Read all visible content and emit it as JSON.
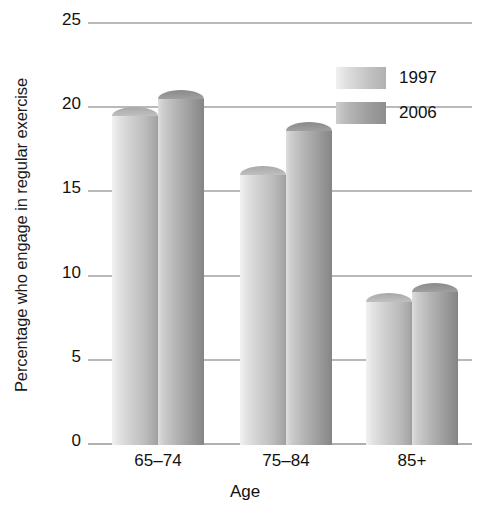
{
  "chart_data": {
    "type": "bar",
    "title": "",
    "xlabel": "Age",
    "ylabel": "Percentage who engage in regular exercise",
    "categories": [
      "65–74",
      "75–84",
      "85+"
    ],
    "series": [
      {
        "name": "1997",
        "values": [
          20.1,
          16.6,
          9.0
        ],
        "color": "#c6c6c6"
      },
      {
        "name": "2006",
        "values": [
          21.1,
          19.2,
          9.6
        ],
        "color": "#a0a0a0"
      }
    ],
    "ylim": [
      0,
      25
    ],
    "yticks": [
      0,
      5,
      10,
      15,
      20,
      25
    ],
    "ytick_labels": [
      "0",
      "5",
      "10",
      "15",
      "20",
      "25"
    ],
    "grid": true,
    "legend_position": "top-right"
  },
  "axis": {
    "y_title": "Percentage who engage in regular exercise",
    "x_title": "Age",
    "ticks": [
      {
        "label": "25"
      },
      {
        "label": "20"
      },
      {
        "label": "15"
      },
      {
        "label": "10"
      },
      {
        "label": "5"
      },
      {
        "label": "0"
      }
    ]
  },
  "categories": [
    {
      "label": "65–74"
    },
    {
      "label": "75–84"
    },
    {
      "label": "85+"
    }
  ],
  "legend": {
    "entries": [
      {
        "label": "1997"
      },
      {
        "label": "2006"
      }
    ]
  }
}
